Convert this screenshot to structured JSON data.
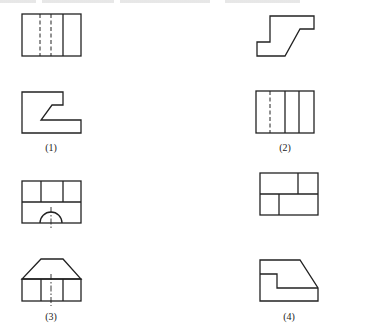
{
  "header": {
    "note": "top text line is cropped and illegible"
  },
  "figures": [
    {
      "id": 1,
      "label": "(1)",
      "views": [
        "front view: rectangle with two hidden (dashed) lines and one solid vertical line",
        "top view: stepped profile with inclined edge"
      ]
    },
    {
      "id": 2,
      "label": "(2)",
      "views": [
        "front view: stepped profile with inclined edge",
        "top view: rectangle with one hidden line and two solid vertical lines"
      ]
    },
    {
      "id": 3,
      "label": "(3)",
      "views": [
        "front view: rectangle divided into three upper cells with semicircular cut-out and centerline",
        "top view: trapezoid over rectangle with three cells and centerline"
      ]
    },
    {
      "id": 4,
      "label": "(4)",
      "views": [
        "front view: rectangle divided into offset cells",
        "top view: stepped profile with chamfered corner"
      ]
    }
  ],
  "colors": {
    "line": "#222222",
    "background": "#ffffff"
  }
}
